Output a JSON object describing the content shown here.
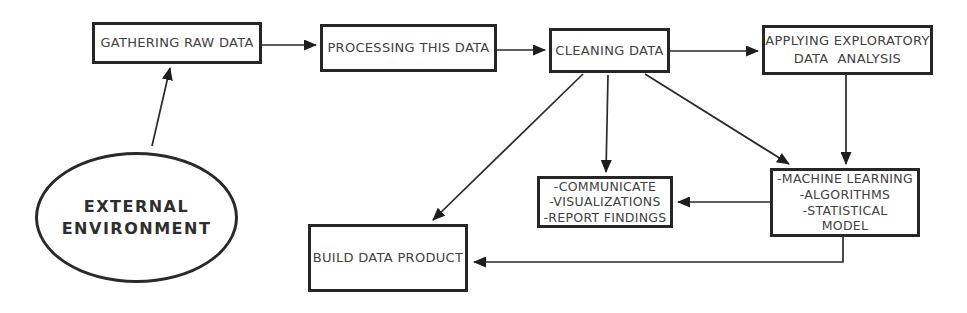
{
  "colors": {
    "background": "#ffffff",
    "line": "#2a2a2a",
    "box_border": "#262626",
    "text": "#414141"
  },
  "nodes": {
    "gathering_raw_data": {
      "label": "GATHERING RAW DATA"
    },
    "processing_this_data": {
      "label": "PROCESSING THIS DATA"
    },
    "cleaning_data": {
      "label": "CLEANING DATA"
    },
    "applying_exploratory_data_analysis": {
      "lines": [
        "APPLYING EXPLORATORY",
        "DATA  ANALYSIS"
      ]
    },
    "external_environment": {
      "lines": [
        "EXTERNAL",
        "ENVIRONMENT"
      ]
    },
    "communicate": {
      "lines": [
        "-COMMUNICATE",
        "-VISUALIZATIONS",
        "-REPORT FINDINGS"
      ]
    },
    "machine_learning": {
      "lines": [
        "-MACHINE LEARNING",
        "-ALGORITHMS",
        "-STATISTICAL",
        "MODEL"
      ]
    },
    "build_data_product": {
      "label": "BUILD DATA PRODUCT"
    }
  },
  "edges": [
    {
      "from": "external_environment",
      "to": "gathering_raw_data"
    },
    {
      "from": "gathering_raw_data",
      "to": "processing_this_data"
    },
    {
      "from": "processing_this_data",
      "to": "cleaning_data"
    },
    {
      "from": "cleaning_data",
      "to": "applying_exploratory_data_analysis"
    },
    {
      "from": "cleaning_data",
      "to": "build_data_product"
    },
    {
      "from": "cleaning_data",
      "to": "communicate"
    },
    {
      "from": "cleaning_data",
      "to": "machine_learning"
    },
    {
      "from": "applying_exploratory_data_analysis",
      "to": "machine_learning"
    },
    {
      "from": "machine_learning",
      "to": "communicate"
    },
    {
      "from": "machine_learning",
      "to": "build_data_product"
    }
  ]
}
